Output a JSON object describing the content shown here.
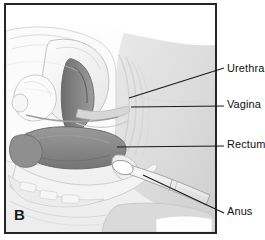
{
  "figure": {
    "panel_letter": "B",
    "frame_color": "#262626",
    "background_color": "#ffffff"
  },
  "callouts": [
    {
      "id": "urethra",
      "label": "Urethra",
      "leader_from": [
        125,
        95
      ],
      "leader_to": [
        224,
        68
      ]
    },
    {
      "id": "vagina",
      "label": "Vagina",
      "leader_from": [
        127,
        104
      ],
      "leader_to": [
        224,
        104
      ]
    },
    {
      "id": "rectum",
      "label": "Rectum",
      "leader_from": [
        113,
        144
      ],
      "leader_to": [
        224,
        144
      ]
    },
    {
      "id": "anus",
      "label": "Anus",
      "leader_from": [
        139,
        172
      ],
      "leader_to": [
        224,
        211
      ]
    }
  ],
  "anatomy": {
    "title": "Female pelvis sagittal section with rectal suppository insertion",
    "structures": [
      {
        "name": "body-outline",
        "tone": "#f2f2f2"
      },
      {
        "name": "abdominal-wall",
        "tone": "#fafafa"
      },
      {
        "name": "bladder",
        "tone": "#f4f4f4"
      },
      {
        "name": "uterus",
        "tone": "#ededed"
      },
      {
        "name": "vaginal-canal",
        "tone": "#8e8e8e"
      },
      {
        "name": "rectum",
        "tone": "#8a8a8a"
      },
      {
        "name": "anal-canal",
        "tone": "#9a9a9a"
      },
      {
        "name": "sacrum-vertebrae",
        "tone": "#e4e4e4"
      },
      {
        "name": "gluteal-region",
        "tone": "#dcdcdc"
      },
      {
        "name": "gloved-finger",
        "tone": "#fbfbfb"
      },
      {
        "name": "suppository",
        "tone": "#ffffff"
      }
    ],
    "colors": {
      "lumen_dark": "#6f6f6f",
      "organ_mid": "#8d8d8d",
      "tissue_light": "#efefef",
      "outline": "#5a5a5a",
      "shadow": "#cfcfcf"
    }
  }
}
